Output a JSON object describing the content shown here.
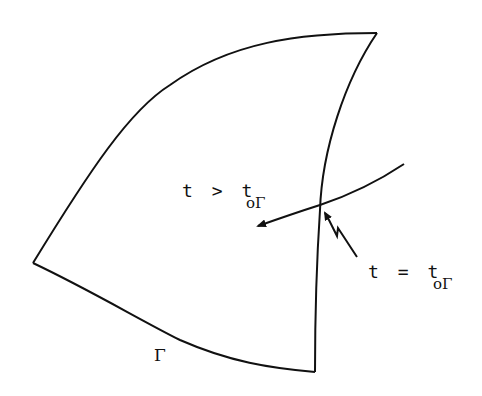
{
  "diagram": {
    "region_boundary_label": "Γ",
    "interior_label": {
      "var": "t",
      "op": ">",
      "rhs": "t",
      "rhs_subscript": "oΓ"
    },
    "boundary_crossing_label": {
      "var": "t",
      "op": "=",
      "rhs": "t",
      "rhs_subscript": "oΓ"
    },
    "stroke_color": "#111111",
    "background_color": "#ffffff"
  }
}
